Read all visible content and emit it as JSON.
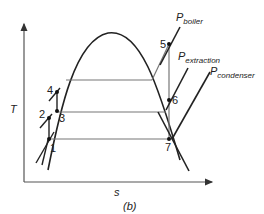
{
  "diagram": {
    "type": "T-s diagram, regenerative Rankine cycle with open feedwater heater",
    "caption": "(b)",
    "axes": {
      "y_label": "T",
      "x_label": "s"
    },
    "isobars": [
      {
        "label_main": "P",
        "label_sub": "boiler"
      },
      {
        "label_main": "P",
        "label_sub": "extraction"
      },
      {
        "label_main": "P",
        "label_sub": "condenser"
      }
    ],
    "state_points": [
      {
        "id": "1",
        "label": "1"
      },
      {
        "id": "2",
        "label": "2"
      },
      {
        "id": "3",
        "label": "3"
      },
      {
        "id": "4",
        "label": "4"
      },
      {
        "id": "5",
        "label": "5"
      },
      {
        "id": "6",
        "label": "6"
      },
      {
        "id": "7",
        "label": "7"
      }
    ]
  }
}
